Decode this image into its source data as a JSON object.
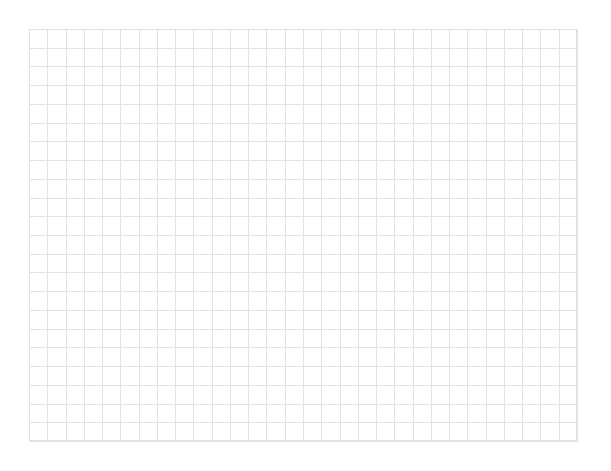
{
  "grid": {
    "columns": 30,
    "rows": 22,
    "width": 548,
    "height": 412,
    "line_color": "#e2e2e2",
    "background": "#ffffff"
  }
}
